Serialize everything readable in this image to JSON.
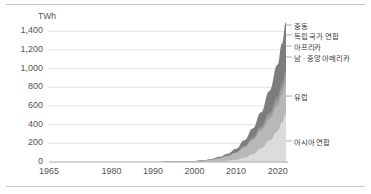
{
  "chart_data": {
    "type": "area",
    "stacked": true,
    "title": "",
    "subtitle": "",
    "xlabel": "",
    "ylabel": "TWh",
    "unit_label": "TWh",
    "grid": true,
    "grid_axis": "y",
    "legend_position": "right-inline",
    "xlim": [
      1965,
      2022
    ],
    "ylim": [
      0,
      1500
    ],
    "ytick_labels": [
      "1,400",
      "1,200",
      "1,000",
      "800",
      "600",
      "400",
      "200",
      "0"
    ],
    "ytick_values": [
      1400,
      1200,
      1000,
      800,
      600,
      400,
      200,
      0
    ],
    "xtick_labels": [
      "1965",
      "1980",
      "1990",
      "2000",
      "2010",
      "2020"
    ],
    "xtick_values": [
      1965,
      1980,
      1990,
      2000,
      2010,
      2020
    ],
    "x": [
      1965,
      1970,
      1975,
      1980,
      1985,
      1990,
      1995,
      2000,
      2002,
      2004,
      2006,
      2008,
      2010,
      2012,
      2014,
      2016,
      2018,
      2020,
      2021,
      2022
    ],
    "series": [
      {
        "name": "아시아 연합",
        "color": "#dcdcdc",
        "values": [
          0,
          0,
          0,
          0,
          0,
          0,
          1,
          2,
          3,
          5,
          8,
          14,
          24,
          46,
          84,
          145,
          230,
          330,
          420,
          520
        ]
      },
      {
        "name": "유럽",
        "color": "#b8b8b8",
        "values": [
          0,
          0,
          0,
          0,
          0,
          1,
          2,
          6,
          10,
          18,
          30,
          48,
          72,
          110,
          150,
          190,
          230,
          270,
          300,
          330
        ]
      },
      {
        "name": "남 · 중앙 아메리카",
        "color": "#a2a2a2",
        "values": [
          0,
          0,
          0,
          0,
          0,
          0,
          0,
          1,
          1,
          2,
          3,
          4,
          6,
          10,
          16,
          26,
          40,
          58,
          70,
          85
        ]
      },
      {
        "name": "아프리카",
        "color": "#949494",
        "values": [
          0,
          0,
          0,
          0,
          0,
          0,
          0,
          0,
          0,
          1,
          1,
          2,
          3,
          5,
          8,
          13,
          20,
          28,
          34,
          40
        ]
      },
      {
        "name": "독립 국가 연합",
        "color": "#8a8a8a",
        "values": [
          0,
          0,
          0,
          0,
          0,
          0,
          0,
          0,
          0,
          0,
          1,
          1,
          2,
          3,
          5,
          8,
          12,
          18,
          22,
          26
        ]
      },
      {
        "name": "중동",
        "color": "#7d7d7d",
        "values": [
          0,
          0,
          0,
          0,
          0,
          0,
          1,
          2,
          4,
          7,
          12,
          20,
          34,
          58,
          95,
          150,
          230,
          340,
          420,
          500
        ]
      }
    ],
    "series_labels": [
      {
        "name": "중동",
        "y_px": 22
      },
      {
        "name": "독립 국가 연합",
        "y_px": 32
      },
      {
        "name": "아프리카",
        "y_px": 43
      },
      {
        "name": "남 · 중앙 아메리카",
        "y_px": 54
      },
      {
        "name": "유럽",
        "y_px": 93
      },
      {
        "name": "아시아 연합",
        "y_px": 138
      }
    ]
  },
  "colors": {
    "rule": "#c9c9c9",
    "gridline": "#e3e3e3",
    "axis": "#a8a8a8",
    "tick_text": "#555555",
    "label_text": "#3c3c3c",
    "background": "#ffffff"
  }
}
